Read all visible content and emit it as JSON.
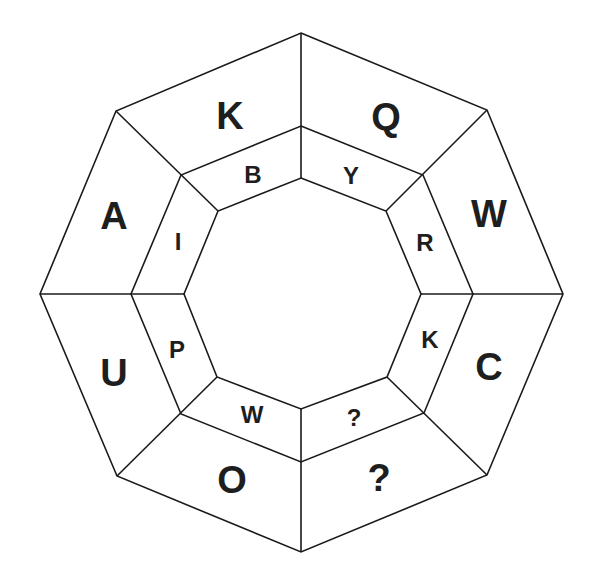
{
  "puzzle": {
    "type": "octagon letter sequence puzzle",
    "outer_ring": {
      "segments": [
        {
          "position": "top-left",
          "label": "K"
        },
        {
          "position": "top-right",
          "label": "Q"
        },
        {
          "position": "right-upper",
          "label": "W"
        },
        {
          "position": "right-lower",
          "label": "C"
        },
        {
          "position": "bottom-right",
          "label": "?"
        },
        {
          "position": "bottom-left",
          "label": "O"
        },
        {
          "position": "left-lower",
          "label": "U"
        },
        {
          "position": "left-upper",
          "label": "A"
        }
      ]
    },
    "inner_ring": {
      "segments": [
        {
          "position": "top-left",
          "label": "B"
        },
        {
          "position": "top-right",
          "label": "Y"
        },
        {
          "position": "right-upper",
          "label": "R"
        },
        {
          "position": "right-lower",
          "label": "K"
        },
        {
          "position": "bottom-right",
          "label": "?"
        },
        {
          "position": "bottom-left",
          "label": "W"
        },
        {
          "position": "left-lower",
          "label": "P"
        },
        {
          "position": "left-upper",
          "label": "I"
        }
      ]
    },
    "colors": {
      "line": "#1a1a1a",
      "text": "#1e1e1e",
      "background": "#ffffff"
    }
  }
}
